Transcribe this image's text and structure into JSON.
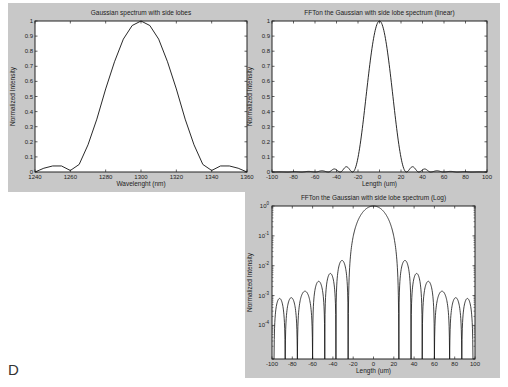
{
  "figure_label": "D",
  "chart_data": [
    {
      "id": "gaussian",
      "type": "line",
      "title": "Gaussian spectrum with side lobes",
      "xlabel": "Wavelenght (nm)",
      "ylabel": "Normalized Intensity",
      "xlim": [
        1240,
        1360
      ],
      "ylim": [
        0,
        1
      ],
      "xticks": [
        1240,
        1260,
        1280,
        1300,
        1320,
        1340,
        1360
      ],
      "yticks": [
        0,
        0.1,
        0.2,
        0.3,
        0.4,
        0.5,
        0.6,
        0.7,
        0.8,
        0.9,
        1
      ],
      "yscale": "linear",
      "grid": false,
      "legend": null,
      "x": [
        1240,
        1245,
        1250,
        1255,
        1260,
        1265,
        1270,
        1275,
        1280,
        1285,
        1290,
        1295,
        1300,
        1305,
        1310,
        1315,
        1320,
        1325,
        1330,
        1335,
        1340,
        1345,
        1350,
        1355,
        1360
      ],
      "y": [
        0.0,
        0.025,
        0.04,
        0.04,
        0.01,
        0.05,
        0.18,
        0.35,
        0.55,
        0.73,
        0.88,
        0.97,
        1.0,
        0.97,
        0.88,
        0.73,
        0.55,
        0.35,
        0.18,
        0.05,
        0.01,
        0.04,
        0.04,
        0.025,
        0.0
      ]
    },
    {
      "id": "fft-linear",
      "type": "line",
      "title": "FFTon the Gaussian with side lobe spectrum (linear)",
      "xlabel": "Length (um)",
      "ylabel": "Normalized Intensity",
      "xlim": [
        -100,
        100
      ],
      "ylim": [
        0,
        1
      ],
      "xticks": [
        -100,
        -80,
        -60,
        -40,
        -20,
        0,
        20,
        40,
        60,
        80,
        100
      ],
      "yticks": [
        0,
        0.1,
        0.2,
        0.3,
        0.4,
        0.5,
        0.6,
        0.7,
        0.8,
        0.9,
        1
      ],
      "yscale": "linear",
      "grid": false,
      "legend": null,
      "main_lobe_null_um": 25,
      "sidelobes": [
        {
          "center": 31,
          "peak": 0.035
        },
        {
          "center": 42,
          "peak": 0.02
        },
        {
          "center": 53,
          "peak": 0.008
        },
        {
          "center": 66,
          "peak": 0.004
        },
        {
          "center": 79,
          "peak": 0.002
        },
        {
          "center": 92,
          "peak": 0.001
        }
      ]
    },
    {
      "id": "fft-log",
      "type": "line",
      "title": "FFTon the Gaussian with side lobe spectrum (Log)",
      "xlabel": "Length (um)",
      "ylabel": "Normalized Intensity",
      "xlim": [
        -100,
        100
      ],
      "ylim": [
        7.5e-06,
        1
      ],
      "xticks": [
        -100,
        -80,
        -60,
        -40,
        -20,
        0,
        20,
        40,
        60,
        80,
        100
      ],
      "ytick_exponents": [
        0,
        -1,
        -2,
        -3,
        -4
      ],
      "yscale": "log",
      "grid": false,
      "legend": null,
      "main_lobe_null_um": 25,
      "nulls_um": [
        25,
        37,
        48,
        60,
        75,
        87,
        98
      ],
      "sidelobe_peaks": [
        {
          "center": 31,
          "peak": 0.015
        },
        {
          "center": 42.5,
          "peak": 0.0055
        },
        {
          "center": 54,
          "peak": 0.003
        },
        {
          "center": 67.5,
          "peak": 0.0014
        },
        {
          "center": 81,
          "peak": 0.00085
        },
        {
          "center": 92.5,
          "peak": 0.0008
        }
      ]
    }
  ]
}
